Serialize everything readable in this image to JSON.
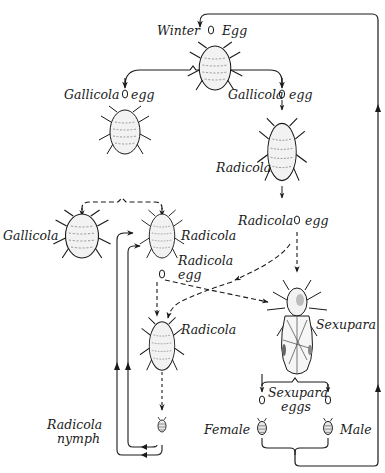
{
  "figure": {
    "type": "life-cycle diagram",
    "colors": {
      "ink": "#1a1a1a",
      "background": "#ffffff",
      "body_fill": "#f2f2f2"
    }
  },
  "labels": {
    "winter": "Winter",
    "winter_egg": "Egg",
    "gallicola_egg_left": "Gallicola",
    "gallicola_egg_left_suffix": "egg",
    "gallicola_egg_right": "Gallicola",
    "gallicola_egg_right_suffix": "egg",
    "radicola_right": "Radicola",
    "radicola_egg_right": "Radicola",
    "radicola_egg_right_suffix": "egg",
    "gallicola_adult": "Gallicola",
    "radicola_mid": "Radicola",
    "radicola_egg_mid_line1": "Radicola",
    "radicola_egg_mid_line2": "egg",
    "sexupara": "Sexupara",
    "radicola_lower": "Radicola",
    "sexupara_eggs_line1": "Sexupara",
    "sexupara_eggs_line2": "eggs",
    "radicola_nymph_line1": "Radicola",
    "radicola_nymph_line2": "nymph",
    "female": "Female",
    "male": "Male"
  },
  "nodes": [
    {
      "id": "winter-egg",
      "kind": "egg"
    },
    {
      "id": "stem-mother",
      "kind": "adult"
    },
    {
      "id": "gallicola-egg-left",
      "kind": "egg"
    },
    {
      "id": "gallicola-egg-right",
      "kind": "egg"
    },
    {
      "id": "gallicola-adult-top",
      "kind": "adult"
    },
    {
      "id": "radicola-right",
      "kind": "adult"
    },
    {
      "id": "radicola-egg-right",
      "kind": "egg"
    },
    {
      "id": "gallicola-adult",
      "kind": "adult"
    },
    {
      "id": "radicola-mid",
      "kind": "adult"
    },
    {
      "id": "radicola-egg-mid",
      "kind": "egg"
    },
    {
      "id": "sexupara",
      "kind": "winged adult"
    },
    {
      "id": "radicola-lower",
      "kind": "adult"
    },
    {
      "id": "radicola-nymph",
      "kind": "nymph"
    },
    {
      "id": "sexupara-egg-female",
      "kind": "egg"
    },
    {
      "id": "sexupara-egg-male",
      "kind": "egg"
    },
    {
      "id": "female",
      "kind": "sexual form"
    },
    {
      "id": "male",
      "kind": "sexual form"
    }
  ]
}
